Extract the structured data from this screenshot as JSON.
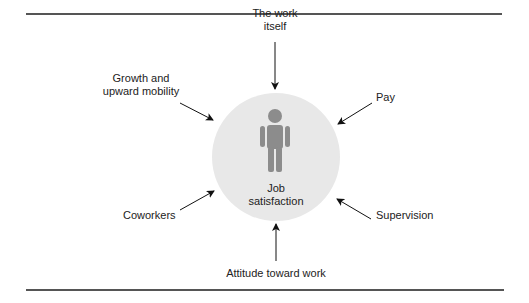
{
  "diagram": {
    "center": {
      "label_line1": "Job",
      "label_line2": "satisfaction",
      "circle_color": "#e8e8e8",
      "figure_color": "#8c8c8c"
    },
    "factors": [
      {
        "id": "work-itself",
        "line1": "The work",
        "line2": "itself"
      },
      {
        "id": "pay",
        "line1": "Pay"
      },
      {
        "id": "supervision",
        "line1": "Supervision"
      },
      {
        "id": "attitude",
        "line1": "Attitude toward work"
      },
      {
        "id": "coworkers",
        "line1": "Coworkers"
      },
      {
        "id": "growth",
        "line1": "Growth and",
        "line2": "upward mobility"
      }
    ]
  }
}
